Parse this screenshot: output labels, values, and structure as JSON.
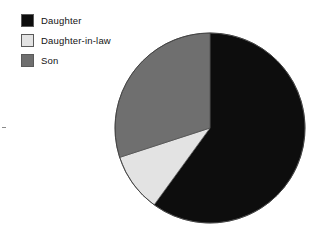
{
  "legend": {
    "position": "top-left",
    "items": [
      {
        "label": "Daughter",
        "color": "#0d0d0d",
        "swatch_name": "legend-swatch-daughter"
      },
      {
        "label": "Daughter-in-law",
        "color": "#e3e3e3",
        "swatch_name": "legend-swatch-daughter-in-law"
      },
      {
        "label": "Son",
        "color": "#6f6f6f",
        "swatch_name": "legend-swatch-son"
      }
    ]
  },
  "chart_data": {
    "type": "pie",
    "title": "",
    "subtitle": "",
    "xlabel": "",
    "ylabel": "",
    "labels": [
      "Daughter",
      "Daughter-in-law",
      "Son"
    ],
    "values": [
      60,
      10,
      30
    ],
    "units": "percent",
    "colors": [
      "#0d0d0d",
      "#e3e3e3",
      "#6f6f6f"
    ],
    "start_angle_deg": 0,
    "direction": "clockwise",
    "legend_position": "top-left",
    "grid": false,
    "annotations": [],
    "slices": [
      {
        "label": "Daughter",
        "value": 60,
        "start_deg": 0,
        "end_deg": 216,
        "color": "#0d0d0d"
      },
      {
        "label": "Daughter-in-law",
        "value": 10,
        "start_deg": 216,
        "end_deg": 252,
        "color": "#e3e3e3"
      },
      {
        "label": "Son",
        "value": 30,
        "start_deg": 252,
        "end_deg": 360,
        "color": "#6f6f6f"
      }
    ]
  },
  "geometry": {
    "center_x": 97,
    "center_y": 97,
    "radius": 95
  }
}
